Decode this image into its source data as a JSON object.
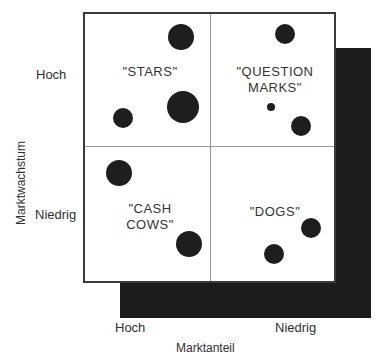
{
  "diagram": {
    "type": "bcg-matrix",
    "y_axis": {
      "title": "Marktwachstum",
      "high_label": "Hoch",
      "low_label": "Niedrig"
    },
    "x_axis": {
      "title": "Marktanteil",
      "high_label": "Hoch",
      "low_label": "Niedrig"
    },
    "quadrants": [
      {
        "id": "stars",
        "label": "\"STARS\"",
        "position": "top-left",
        "bubbles": [
          {
            "x": 0.77,
            "y": 0.83,
            "size": "medium"
          },
          {
            "x": 0.78,
            "y": 0.3,
            "size": "large"
          },
          {
            "x": 0.3,
            "y": 0.22,
            "size": "small"
          }
        ]
      },
      {
        "id": "question-marks",
        "label": "\"QUESTION\nMARKS\"",
        "position": "top-right",
        "bubbles": [
          {
            "x": 0.59,
            "y": 0.85,
            "size": "small"
          },
          {
            "x": 0.48,
            "y": 0.3,
            "size": "tiny"
          },
          {
            "x": 0.72,
            "y": 0.16,
            "size": "small"
          }
        ]
      },
      {
        "id": "cash-cows",
        "label": "\"CASH\nCOWS\"",
        "position": "bottom-left",
        "bubbles": [
          {
            "x": 0.27,
            "y": 0.81,
            "size": "medium"
          },
          {
            "x": 0.83,
            "y": 0.28,
            "size": "medium"
          }
        ]
      },
      {
        "id": "dogs",
        "label": "\"DOGS\"",
        "position": "bottom-right",
        "bubbles": [
          {
            "x": 0.8,
            "y": 0.4,
            "size": "small"
          },
          {
            "x": 0.5,
            "y": 0.2,
            "size": "small"
          }
        ]
      }
    ],
    "colors": {
      "bubble": "#1e1e1e",
      "shadow": "#1c1c1c",
      "frame": "#3a3a3a",
      "divider": "#9a9a9a"
    }
  }
}
